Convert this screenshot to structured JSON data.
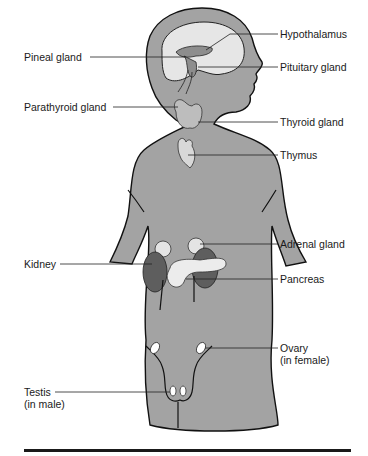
{
  "figure": {
    "labels": {
      "hypothalamus": "Hypothalamus",
      "pineal_gland": "Pineal gland",
      "pituitary_gland": "Pituitary gland",
      "parathyroid_gland": "Parathyroid gland",
      "thyroid_gland": "Thyroid gland",
      "thymus": "Thymus",
      "adrenal_gland": "Adrenal gland",
      "kidney": "Kidney",
      "pancreas": "Pancreas",
      "ovary": "Ovary\n(in female)",
      "testis": "Testis\n(in male)"
    },
    "colors": {
      "body": "#a3a3a3",
      "outline": "#111111",
      "brain": "#e6e6e6",
      "kidney": "#5e5e5e",
      "gland_light": "#e4e4e4"
    }
  }
}
